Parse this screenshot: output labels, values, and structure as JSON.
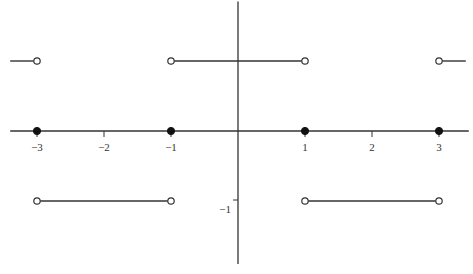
{
  "chart_data": {
    "type": "line",
    "title": "",
    "xlabel": "",
    "ylabel": "",
    "xlim": [
      -3.4,
      3.4
    ],
    "ylim": [
      -1.9,
      1.85
    ],
    "grid": false,
    "x_ticks": [
      {
        "value": -3,
        "label": "−3"
      },
      {
        "value": -2,
        "label": "−2"
      },
      {
        "value": -1,
        "label": "−1"
      },
      {
        "value": 1,
        "label": "1"
      },
      {
        "value": 2,
        "label": "2"
      },
      {
        "value": 3,
        "label": "3"
      }
    ],
    "y_ticks": [
      {
        "value": -1,
        "label": "−1"
      }
    ],
    "segments": [
      {
        "x": [
          -3.4,
          -3
        ],
        "y": 1,
        "left_open": false,
        "right_open": true
      },
      {
        "x": [
          -3,
          -1
        ],
        "y": -1,
        "left_open": true,
        "right_open": true
      },
      {
        "x": [
          -1,
          1
        ],
        "y": 1,
        "left_open": true,
        "right_open": true
      },
      {
        "x": [
          1,
          3
        ],
        "y": -1,
        "left_open": true,
        "right_open": true
      },
      {
        "x": [
          3,
          3.4
        ],
        "y": 1,
        "left_open": true,
        "right_open": false
      }
    ],
    "points": [
      {
        "x": -3,
        "y": 0,
        "filled": true
      },
      {
        "x": -1,
        "y": 0,
        "filled": true
      },
      {
        "x": 1,
        "y": 0,
        "filled": true
      },
      {
        "x": 3,
        "y": 0,
        "filled": true
      }
    ],
    "colors": {
      "line": "#333333",
      "axis": "#333333",
      "background": "#ffffff"
    }
  }
}
